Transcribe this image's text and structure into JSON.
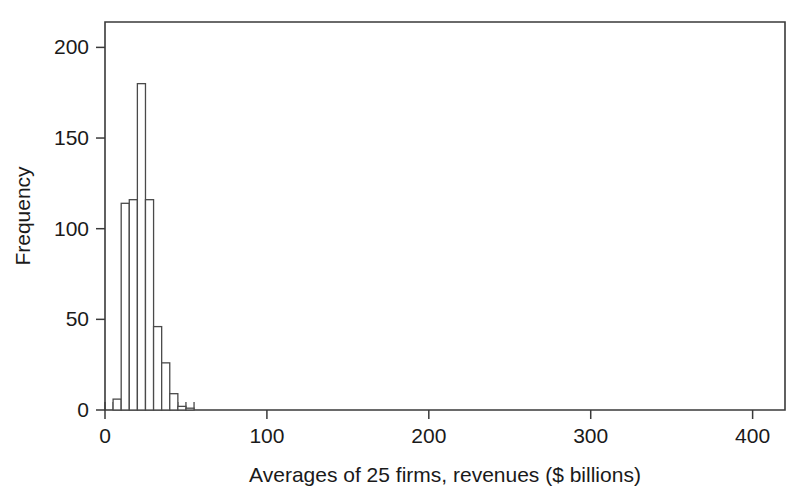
{
  "chart_data": {
    "type": "bar",
    "title": "",
    "subtitle": "",
    "xlabel": "Averages of 25 firms, revenues ($ billions)",
    "ylabel": "Frequency",
    "xlim": [
      0,
      420
    ],
    "ylim": [
      0,
      214
    ],
    "grid": false,
    "legend": false,
    "bin_width": 5,
    "bin_starts": [
      5,
      10,
      15,
      20,
      25,
      30,
      35,
      40,
      45,
      50
    ],
    "categories": [
      "5-10",
      "10-15",
      "15-20",
      "20-25",
      "25-30",
      "30-35",
      "35-40",
      "40-45",
      "45-50",
      "50-55"
    ],
    "values": [
      6,
      114,
      116,
      180,
      116,
      46,
      26,
      9,
      2,
      1
    ],
    "x_ticks": [
      0,
      100,
      200,
      300,
      400
    ],
    "x_tick_labels": [
      "0",
      "100",
      "200",
      "300",
      "400"
    ],
    "y_ticks": [
      0,
      50,
      100,
      150,
      200
    ],
    "y_tick_labels": [
      "0",
      "50",
      "100",
      "150",
      "200"
    ],
    "x_minor_tick_step": 5,
    "x_minor_tick_max": 55,
    "bar_fill_color": "#ffffff",
    "bar_edge_color": "#4a4a4a",
    "axis_color": "#3a3a3a",
    "background_color": "#ffffff"
  },
  "figure": {
    "width": 806,
    "height": 497,
    "plot_left": 105,
    "plot_right": 785,
    "plot_top": 22,
    "plot_bottom": 410
  }
}
